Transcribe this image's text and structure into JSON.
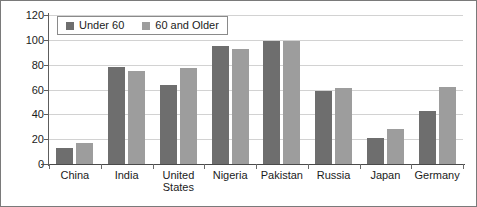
{
  "chart_data": {
    "type": "bar",
    "title": "",
    "subtitle": "",
    "xlabel": "",
    "ylabel": "",
    "ylim": [
      0,
      120
    ],
    "yticks": [
      0,
      20,
      40,
      60,
      80,
      100,
      120
    ],
    "ytick_labels": [
      "0",
      "20",
      "40",
      "60",
      "80",
      "100",
      "120"
    ],
    "grid": true,
    "legend_position": "top-left",
    "categories": [
      "China",
      "India",
      "United States",
      "Nigeria",
      "Pakistan",
      "Russia",
      "Japan",
      "Germany"
    ],
    "category_lines": [
      [
        "China"
      ],
      [
        "India"
      ],
      [
        "United",
        "States"
      ],
      [
        "Nigeria"
      ],
      [
        "Pakistan"
      ],
      [
        "Russia"
      ],
      [
        "Japan"
      ],
      [
        "Germany"
      ]
    ],
    "series": [
      {
        "name": "Under 60",
        "color": "#6e6e6e",
        "values": [
          13,
          78,
          64,
          95,
          99,
          59,
          21,
          43
        ]
      },
      {
        "name": "60 and Older",
        "color": "#9d9d9d",
        "values": [
          17,
          75,
          77,
          93,
          99,
          61,
          28,
          62
        ]
      }
    ]
  },
  "legend": {
    "entries": [
      {
        "label": "Under 60"
      },
      {
        "label": "60 and Older"
      }
    ]
  },
  "colors": {
    "series_under_60": "#6e6e6e",
    "series_60_and_older": "#9d9d9d",
    "gridline": "#d2d2d2",
    "axis": "#4a4a4a",
    "border": "#7a7a7a",
    "background": "#ffffff",
    "text": "#1b1b1b"
  }
}
